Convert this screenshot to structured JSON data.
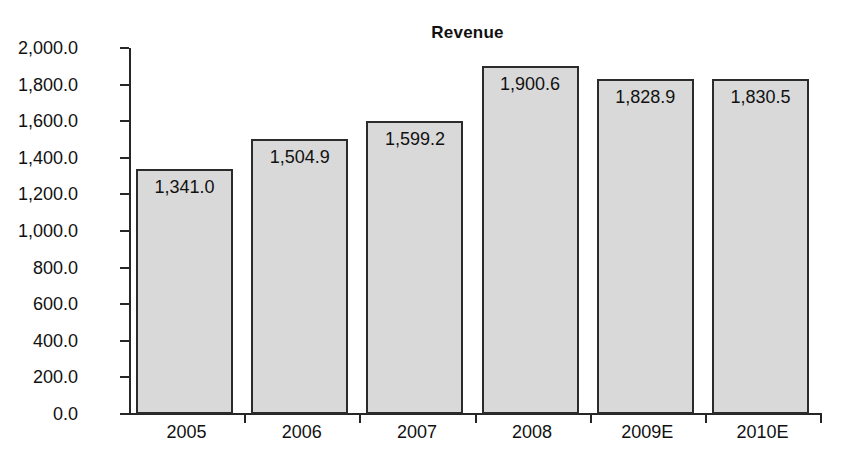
{
  "chart_data": {
    "type": "bar",
    "title": "Revenue",
    "xlabel": "",
    "ylabel": "",
    "categories": [
      "2005",
      "2006",
      "2007",
      "2008",
      "2009E",
      "2010E"
    ],
    "values": [
      1341.0,
      1504.9,
      1599.2,
      1900.6,
      1828.9,
      1830.5
    ],
    "value_labels": [
      "1,341.0",
      "1,504.9",
      "1,599.2",
      "1,900.6",
      "1,828.9",
      "1,830.5"
    ],
    "ylim": [
      0,
      2000
    ],
    "ytick_step": 200,
    "ytick_labels": [
      "2,000.0",
      "1,800.0",
      "1,600.0",
      "1,400.0",
      "1,200.0",
      "1,000.0",
      "800.0",
      "600.0",
      "400.0",
      "200.0",
      "0.0"
    ],
    "ytick_values": [
      2000,
      1800,
      1600,
      1400,
      1200,
      1000,
      800,
      600,
      400,
      200,
      0
    ],
    "grid": false,
    "legend": false,
    "series": [
      {
        "name": "Revenue",
        "values": [
          1341.0,
          1504.9,
          1599.2,
          1900.6,
          1828.9,
          1830.5
        ]
      }
    ],
    "colors": {
      "bar_fill": "#d9d9d9",
      "bar_border": "#2b2b2b",
      "axis": "#262626",
      "text": "#111111",
      "background": "#ffffff"
    }
  }
}
